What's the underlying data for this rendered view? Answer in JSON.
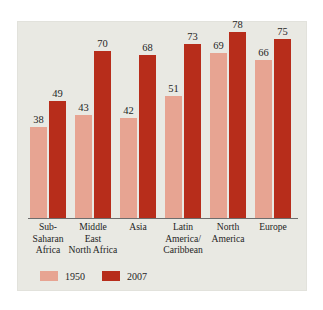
{
  "chart_data": {
    "type": "bar",
    "title": "",
    "subtitle": "",
    "xlabel": "",
    "ylabel": "",
    "ylim": [
      0,
      80
    ],
    "grid": false,
    "legend_position": "bottom-left",
    "categories": [
      "Sub-\nSaharan\nAfrica",
      "Middle\nEast\nNorth Africa",
      "Asia",
      "Latin\nAmerica/\nCaribbean",
      "North\nAmerica",
      "Europe"
    ],
    "series": [
      {
        "name": "1950",
        "color": "#e7a492",
        "values": [
          38,
          43,
          42,
          51,
          69,
          66
        ]
      },
      {
        "name": "2007",
        "color": "#b72d1b",
        "values": [
          49,
          70,
          68,
          73,
          78,
          75
        ]
      }
    ]
  },
  "legend": {
    "entries": [
      {
        "label": "1950"
      },
      {
        "label": "2007"
      }
    ]
  },
  "colors": {
    "series_1950": "#e7a492",
    "series_2007": "#b72d1b",
    "panel_background": "#e9e9e3",
    "page_background": "#ffffff",
    "axis_line": "#6d6d6d",
    "text": "#262626"
  }
}
